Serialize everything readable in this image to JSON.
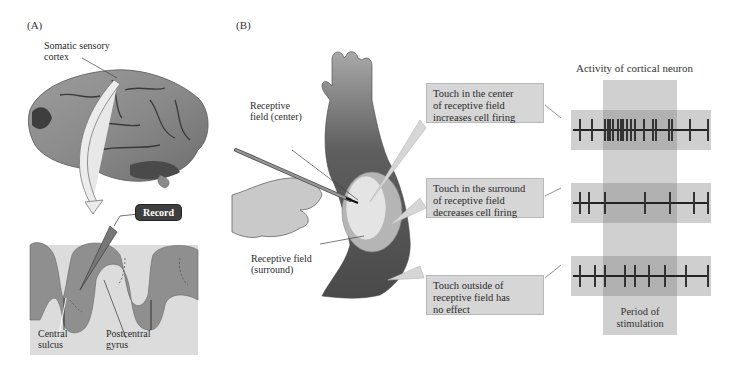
{
  "panel_a": {
    "label": "(A)",
    "somatic_label_line1": "Somatic sensory",
    "somatic_label_line2": "cortex",
    "record_label": "Record",
    "central_sulcus_line1": "Central",
    "central_sulcus_line2": "sulcus",
    "postcentral_line1": "Postcentral",
    "postcentral_line2": "gyrus"
  },
  "panel_b": {
    "label": "(B)",
    "rf_center_line1": "Receptive",
    "rf_center_line2": "field (center)",
    "rf_surround_line1": "Receptive field",
    "rf_surround_line2": "(surround)",
    "callouts": [
      {
        "line1": "Touch in the center",
        "line2": "of receptive field",
        "line3": "increases cell firing"
      },
      {
        "line1": "Touch in the surround",
        "line2": "of receptive field",
        "line3": "decreases cell firing"
      },
      {
        "line1": "Touch outside of",
        "line2": "receptive field has",
        "line3": "no effect"
      }
    ],
    "activity_title": "Activity of cortical neuron",
    "stim_label_line1": "Period of",
    "stim_label_line2": "stimulation",
    "spike_trains": [
      {
        "condition": "center",
        "spikes_x": [
          579,
          591,
          604,
          607,
          609,
          612,
          617,
          620,
          622,
          626,
          630,
          634,
          643,
          652,
          655,
          668,
          671,
          689,
          707
        ]
      },
      {
        "condition": "surround",
        "spikes_x": [
          579,
          588,
          604,
          644,
          669,
          693,
          707
        ]
      },
      {
        "condition": "outside",
        "spikes_x": [
          579,
          594,
          604,
          624,
          634,
          648,
          664,
          685,
          707
        ]
      }
    ]
  },
  "colors": {
    "callout_bg": "#d6d6d6",
    "trace_bg": "#cfcfcf",
    "stim_overlay": "#8a8a8a",
    "brain": "#8c8c8c",
    "cortex_band": "#8f8f8f",
    "record_badge": "#3f3f3f"
  }
}
